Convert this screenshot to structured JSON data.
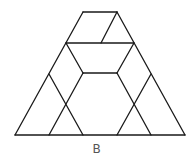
{
  "figure": {
    "label": "B",
    "stroke_color": "#1a1a1a",
    "lines": [
      [
        15,
        135,
        185,
        135
      ],
      [
        15,
        135,
        83,
        12
      ],
      [
        185,
        135,
        117,
        12
      ],
      [
        83,
        12,
        117,
        12
      ],
      [
        66,
        43,
        134,
        43
      ],
      [
        117,
        12,
        101,
        43
      ],
      [
        66,
        43,
        83,
        73
      ],
      [
        134,
        43,
        117,
        73
      ],
      [
        83,
        73,
        117,
        73
      ],
      [
        83,
        73,
        49,
        135
      ],
      [
        117,
        73,
        151,
        135
      ],
      [
        49,
        74,
        83,
        135
      ],
      [
        151,
        74,
        117,
        135
      ]
    ]
  }
}
